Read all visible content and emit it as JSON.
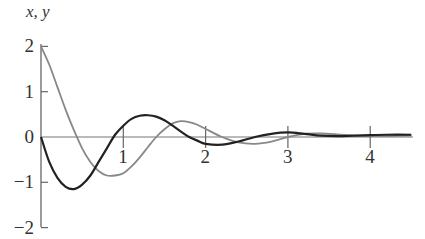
{
  "chart_data": {
    "type": "line",
    "title": "",
    "ylabel": "x, y",
    "xlabel": "",
    "xlim": [
      0,
      4.5
    ],
    "ylim": [
      -2,
      2
    ],
    "x_ticks": [
      "1",
      "2",
      "3",
      "4"
    ],
    "y_ticks": [
      "2",
      "1",
      "0",
      "−1",
      "−2"
    ],
    "grid": false,
    "legend": null,
    "series": [
      {
        "name": "x",
        "color": "#888888",
        "x": [
          0,
          0.1,
          0.2,
          0.3,
          0.4,
          0.5,
          0.6,
          0.7,
          0.8,
          0.9,
          1.0,
          1.1,
          1.2,
          1.3,
          1.4,
          1.5,
          1.6,
          1.7,
          1.8,
          1.9,
          2.0,
          2.2,
          2.4,
          2.6,
          2.8,
          3.0,
          3.2,
          3.4,
          3.6,
          3.8,
          4.0,
          4.2,
          4.5
        ],
        "values": [
          2.0,
          1.6,
          1.1,
          0.6,
          0.15,
          -0.25,
          -0.55,
          -0.75,
          -0.85,
          -0.85,
          -0.8,
          -0.65,
          -0.45,
          -0.22,
          0.0,
          0.17,
          0.3,
          0.35,
          0.33,
          0.27,
          0.18,
          0.0,
          -0.12,
          -0.15,
          -0.1,
          0.0,
          0.07,
          0.08,
          0.06,
          0.03,
          0.02,
          0.02,
          0.03
        ]
      },
      {
        "name": "y",
        "color": "#222222",
        "x": [
          0,
          0.1,
          0.2,
          0.3,
          0.4,
          0.5,
          0.6,
          0.7,
          0.8,
          0.9,
          1.0,
          1.1,
          1.2,
          1.3,
          1.4,
          1.5,
          1.6,
          1.7,
          1.8,
          1.9,
          2.0,
          2.2,
          2.4,
          2.6,
          2.8,
          3.0,
          3.2,
          3.4,
          3.6,
          3.8,
          4.0,
          4.2,
          4.5
        ],
        "values": [
          0.0,
          -0.55,
          -0.9,
          -1.1,
          -1.15,
          -1.05,
          -0.85,
          -0.55,
          -0.25,
          0.05,
          0.25,
          0.4,
          0.47,
          0.48,
          0.45,
          0.37,
          0.25,
          0.12,
          0.0,
          -0.08,
          -0.15,
          -0.17,
          -0.1,
          0.0,
          0.07,
          0.1,
          0.07,
          0.03,
          0.02,
          0.03,
          0.04,
          0.05,
          0.05
        ]
      }
    ]
  }
}
